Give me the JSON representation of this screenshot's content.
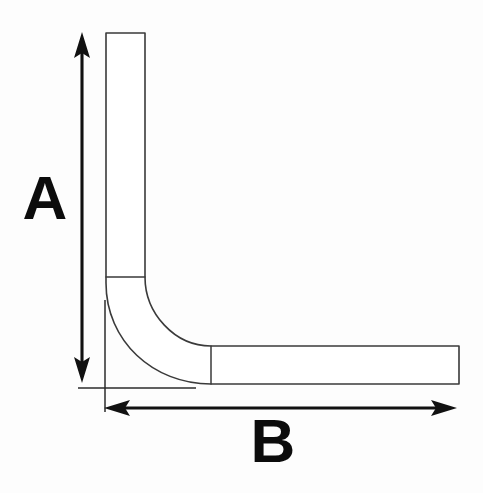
{
  "diagram": {
    "background_color": "#fdfdfd",
    "line_color": "#3a3a3a",
    "dimension_color": "#111111",
    "fill_color": "#ffffff",
    "labels": {
      "vertical_dimension": "A",
      "horizontal_dimension": "B"
    },
    "label_positions": {
      "vertical_dimension": {
        "x": 45,
        "y": 203
      },
      "horizontal_dimension": {
        "x": 273,
        "y": 446
      }
    }
  },
  "geometry": {
    "vertical_leg": {
      "left": 106,
      "right": 145,
      "top": 33,
      "bottom": 277,
      "width": 39,
      "height": 244
    },
    "horizontal_leg": {
      "left": 211,
      "right": 459,
      "top": 346,
      "bottom": 384,
      "width": 248,
      "height": 38
    },
    "bend": {
      "outer_start": {
        "x": 106,
        "y": 283
      },
      "outer_end": {
        "x": 211,
        "y": 384
      },
      "inner_start": {
        "x": 145,
        "y": 277
      },
      "inner_end": {
        "x": 211,
        "y": 346
      },
      "outer_radius": 105,
      "inner_radius": 66
    },
    "dimension_a": {
      "axis": "vertical",
      "x": 82,
      "y_top": 33,
      "y_bottom": 382,
      "length_px": 349,
      "arrowheads": "both"
    },
    "dimension_b": {
      "axis": "horizontal",
      "y": 408,
      "x_left": 105,
      "x_right": 456,
      "length_px": 351,
      "arrowheads": "both"
    },
    "extension_lines": [
      {
        "name": "bottom-extension",
        "x1": 78,
        "y1": 388,
        "x2": 196,
        "y2": 388
      },
      {
        "name": "left-extension",
        "x1": 105,
        "y1": 300,
        "x2": 105,
        "y2": 412
      }
    ]
  }
}
